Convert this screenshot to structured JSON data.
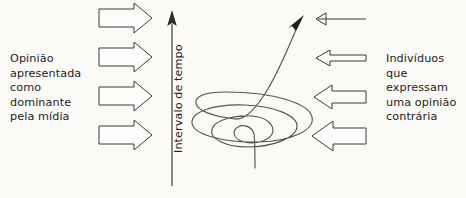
{
  "diagram": {
    "background_color": "#fbfaf7",
    "ink_color": "#1d1d1b",
    "left_caption": "Opinião\napresentada\ncomo\ndominante\npela mídia",
    "right_caption": "Indivíduos que\nexpressam\numa opinião\ncontrária",
    "axis_label": "Intervalo de tempo",
    "axis": {
      "orientation": "vertical",
      "direction": "upward",
      "arrowhead": "solid-triangle",
      "x": 172,
      "y_top": 12,
      "y_bottom": 186
    },
    "left_arrows": [
      {
        "label": "media-arrow-1",
        "direction": "right",
        "style": "outlined",
        "thickness": "medium",
        "y": 18
      },
      {
        "label": "media-arrow-2",
        "direction": "right",
        "style": "outlined",
        "thickness": "medium",
        "y": 57
      },
      {
        "label": "media-arrow-3",
        "direction": "right",
        "style": "outlined",
        "thickness": "medium",
        "y": 96
      },
      {
        "label": "media-arrow-4",
        "direction": "right",
        "style": "outlined",
        "thickness": "medium",
        "y": 135
      }
    ],
    "right_arrows": [
      {
        "label": "dissent-arrow-1",
        "direction": "left",
        "style": "thin-line",
        "thickness": "hairline",
        "y": 19
      },
      {
        "label": "dissent-arrow-2",
        "direction": "left",
        "style": "outlined",
        "thickness": "thin",
        "y": 58
      },
      {
        "label": "dissent-arrow-3",
        "direction": "left",
        "style": "outlined",
        "thickness": "medium",
        "y": 97
      },
      {
        "label": "dissent-arrow-4",
        "direction": "left",
        "style": "outlined",
        "thickness": "thick",
        "y": 136
      }
    ],
    "spiral": {
      "label": "spiral-of-silence-curve",
      "description": "Converging zig-zag spiral narrowing from bottom tail and widening upward, terminating in an arrowhead at top right",
      "arrowhead": "solid-triangle",
      "arrowhead_position": [
        300,
        18
      ],
      "tail_position": [
        255,
        168
      ],
      "turn_count": 5
    }
  }
}
